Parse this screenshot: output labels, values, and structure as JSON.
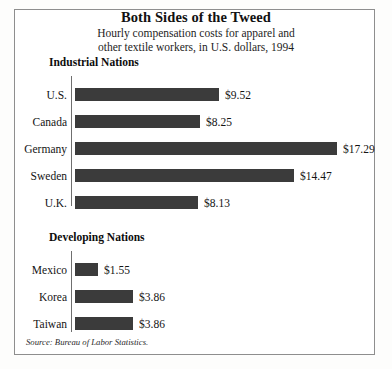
{
  "chart_data": {
    "type": "bar",
    "orientation": "horizontal",
    "title": "Both Sides of the Tweed",
    "subtitle_line1": "Hourly compensation costs for apparel and",
    "subtitle_line2": "other textile workers, in U.S. dollars, 1994",
    "xlabel": "",
    "ylabel": "",
    "xlim": [
      0,
      17.29
    ],
    "grid": false,
    "legend": "none",
    "value_prefix": "$",
    "bar_color": "#3b3b3b",
    "source": "Source: Bureau of Labor Statistics.",
    "groups": [
      {
        "name": "Industrial Nations",
        "categories": [
          "U.S.",
          "Canada",
          "Germany",
          "Sweden",
          "U.K."
        ],
        "values": [
          9.52,
          8.25,
          17.29,
          14.47,
          8.13
        ],
        "labels": [
          "$9.52",
          "$8.25",
          "$17.29",
          "$14.47",
          "$8.13"
        ]
      },
      {
        "name": "Developing Nations",
        "categories": [
          "Mexico",
          "Korea",
          "Taiwan"
        ],
        "values": [
          1.55,
          3.86,
          3.86
        ],
        "labels": [
          "$1.55",
          "$3.86",
          "$3.86"
        ]
      }
    ]
  }
}
